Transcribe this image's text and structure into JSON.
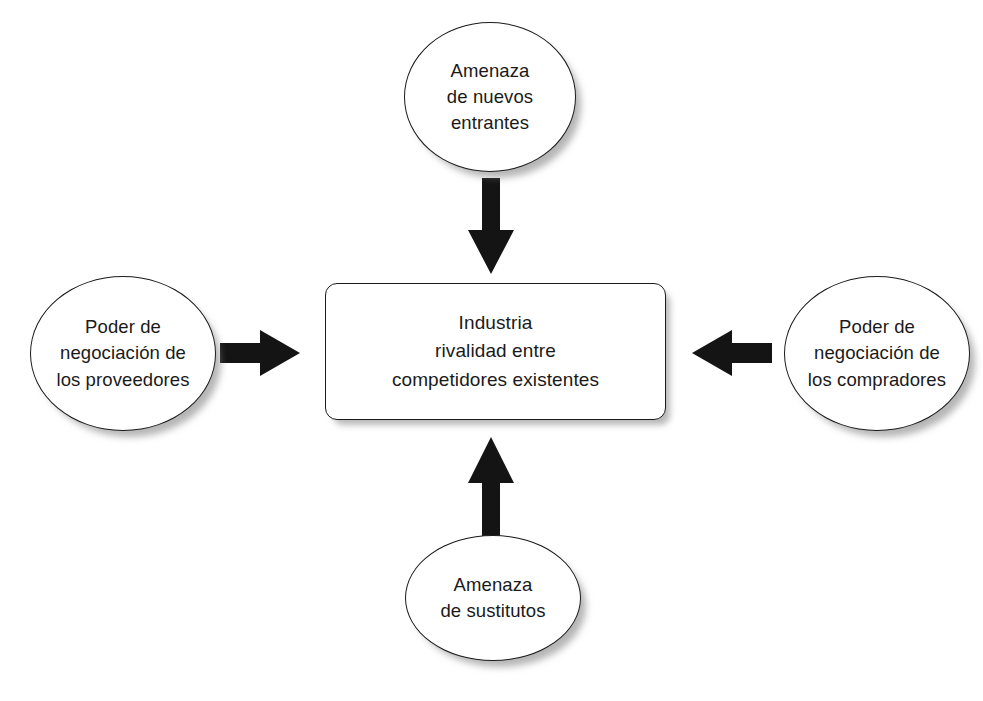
{
  "diagram": {
    "ink_color": "#1b1b1b",
    "arrow_color": "#141414",
    "background": "#ffffff",
    "center": {
      "id": "industria",
      "shape": "rounded-rectangle",
      "lines": [
        "Industria",
        "rivalidad entre",
        "competidores existentes"
      ]
    },
    "forces": [
      {
        "id": "amenaza-nuevos-entrantes",
        "shape": "ellipse",
        "position": "top",
        "lines": [
          "Amenaza",
          "de nuevos",
          "entrantes"
        ]
      },
      {
        "id": "poder-negociacion-proveedores",
        "shape": "ellipse",
        "position": "left",
        "lines": [
          "Poder de",
          "negociación de",
          "los proveedores"
        ]
      },
      {
        "id": "poder-negociacion-compradores",
        "shape": "ellipse",
        "position": "right",
        "lines": [
          "Poder de",
          "negociación de",
          "los compradores"
        ]
      },
      {
        "id": "amenaza-sustitutos",
        "shape": "ellipse",
        "position": "bottom",
        "lines": [
          "Amenaza",
          "de sustitutos"
        ]
      }
    ],
    "arrows": [
      {
        "id": "arrow-top",
        "from": "amenaza-nuevos-entrantes",
        "to": "industria",
        "direction": "down"
      },
      {
        "id": "arrow-left",
        "from": "poder-negociacion-proveedores",
        "to": "industria",
        "direction": "right"
      },
      {
        "id": "arrow-right",
        "from": "poder-negociacion-compradores",
        "to": "industria",
        "direction": "left"
      },
      {
        "id": "arrow-bottom",
        "from": "amenaza-sustitutos",
        "to": "industria",
        "direction": "up"
      }
    ]
  }
}
